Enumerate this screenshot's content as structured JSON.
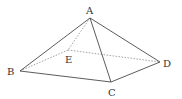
{
  "diagram": {
    "type": "pyramid",
    "vertices": {
      "A": {
        "label": "A",
        "x": 90,
        "y": 18,
        "lx": 86,
        "ly": 14
      },
      "B": {
        "label": "B",
        "x": 20,
        "y": 71,
        "lx": 7,
        "ly": 75
      },
      "C": {
        "label": "C",
        "x": 111,
        "y": 82,
        "lx": 108,
        "ly": 96
      },
      "D": {
        "label": "D",
        "x": 160,
        "y": 62,
        "lx": 163,
        "ly": 67
      },
      "E": {
        "label": "E",
        "x": 68,
        "y": 50,
        "lx": 65,
        "ly": 63
      }
    },
    "solid_edges": [
      [
        "A",
        "B"
      ],
      [
        "A",
        "C"
      ],
      [
        "A",
        "D"
      ],
      [
        "B",
        "C"
      ],
      [
        "C",
        "D"
      ]
    ],
    "dashed_edges": [
      [
        "A",
        "E"
      ],
      [
        "B",
        "E"
      ],
      [
        "E",
        "D"
      ]
    ],
    "colors": {
      "solid": "#4a4a4a",
      "dashed": "#8a8a8a",
      "text": "#333333"
    }
  }
}
